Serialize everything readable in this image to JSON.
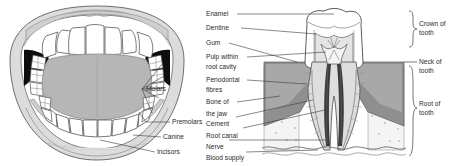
{
  "figure": {
    "background_color": "#ffffff",
    "ink_color": "#2b2b2b"
  },
  "mouth_panel": {
    "name": "open-mouth-diagram",
    "colors": {
      "lip": "#d9d9d9",
      "lip_outline": "#5a5a5a",
      "tongue": "#b4b4b4",
      "throat": "#101010",
      "tooth": "#ffffff",
      "tooth_outline": "#4f4f4f",
      "gum": "#c9c9c9"
    },
    "labels": [
      {
        "id": "molars",
        "text": "Molars"
      },
      {
        "id": "premolars",
        "text": "Premolars"
      },
      {
        "id": "canine",
        "text": "Canine"
      },
      {
        "id": "incisors",
        "text": "Incisors"
      }
    ]
  },
  "tooth_panel": {
    "name": "tooth-cross-section-diagram",
    "colors": {
      "enamel": "#ffffff",
      "dentine": "#e3e3e3",
      "pulp": "#f2f2f2",
      "gum": "#9a9a9a",
      "bone": "#efefef",
      "canal": "#3a3a3a",
      "outline": "#4a4a4a"
    },
    "left_labels": [
      {
        "id": "enamel",
        "text": "Enamel"
      },
      {
        "id": "dentine",
        "text": "Dentine"
      },
      {
        "id": "gum",
        "text": "Gum"
      },
      {
        "id": "pulp-line-1",
        "text": "Pulp within"
      },
      {
        "id": "pulp-line-2",
        "text": "root cavity"
      },
      {
        "id": "periodontal-line-1",
        "text": "Periodontal"
      },
      {
        "id": "periodontal-line-2",
        "text": "fibres"
      },
      {
        "id": "bone-line-1",
        "text": "Bone of"
      },
      {
        "id": "bone-line-2",
        "text": "the jaw"
      },
      {
        "id": "cement",
        "text": "Cement"
      },
      {
        "id": "root-canal",
        "text": "Root canal"
      },
      {
        "id": "nerve",
        "text": "Nerve"
      },
      {
        "id": "blood-supply",
        "text": "Blood supply"
      }
    ],
    "right_labels": [
      {
        "id": "crown",
        "line1": "Crown of",
        "line2": "tooth"
      },
      {
        "id": "neck",
        "line1": "Neck of",
        "line2": "tooth"
      },
      {
        "id": "root",
        "line1": "Root of",
        "line2": "tooth"
      }
    ]
  }
}
